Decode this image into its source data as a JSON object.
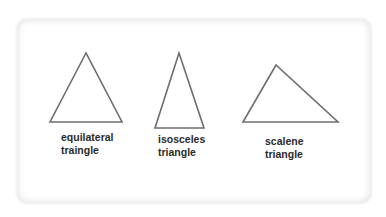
{
  "diagram": {
    "stroke_color": "#6e6e6e",
    "triangles": [
      {
        "id": "equilateral",
        "points": [
          [
            86,
            53
          ],
          [
            50,
            122
          ],
          [
            122,
            122
          ]
        ],
        "label_line1": "equilateral",
        "label_line2": "traingle"
      },
      {
        "id": "isosceles",
        "points": [
          [
            179,
            53
          ],
          [
            155,
            128
          ],
          [
            204,
            128
          ]
        ],
        "label_line1": "isosceles",
        "label_line2": "triangle"
      },
      {
        "id": "scalene",
        "points": [
          [
            276,
            65
          ],
          [
            243,
            122
          ],
          [
            338,
            122
          ]
        ],
        "label_line1": "scalene",
        "label_line2": "triangle"
      }
    ]
  }
}
